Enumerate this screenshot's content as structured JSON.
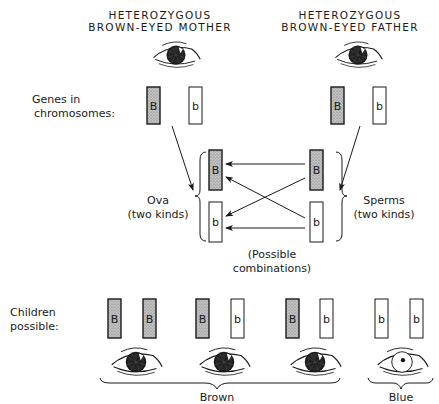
{
  "mother": {
    "title_line1": "HETEROZYGOUS",
    "title_line2": "BROWN-EYED MOTHER",
    "eye_color": "brown",
    "genes": [
      "B",
      "b"
    ]
  },
  "father": {
    "title_line1": "HETEROZYGOUS",
    "title_line2": "BROWN-EYED FATHER",
    "eye_color": "brown",
    "genes": [
      "B",
      "b"
    ]
  },
  "labels": {
    "genes_line1": "Genes in",
    "genes_line2": "chromosomes:",
    "ova_line1": "Ova",
    "ova_line2": "(two kinds)",
    "sperms_line1": "Sperms",
    "sperms_line2": "(two kinds)",
    "combinations_line1": "(Possible",
    "combinations_line2": "combinations)",
    "children_line1": "Children",
    "children_line2": "possible:"
  },
  "ova": [
    "B",
    "b"
  ],
  "sperms": [
    "B",
    "b"
  ],
  "children": [
    {
      "genes": [
        "B",
        "B"
      ],
      "eye_color": "brown"
    },
    {
      "genes": [
        "B",
        "b"
      ],
      "eye_color": "brown"
    },
    {
      "genes": [
        "B",
        "b"
      ],
      "eye_color": "brown"
    },
    {
      "genes": [
        "b",
        "b"
      ],
      "eye_color": "blue"
    }
  ],
  "groups": {
    "brown_label": "Brown",
    "blue_label": "Blue"
  },
  "colors": {
    "dominant_fill": "#b8b8b8",
    "recessive_fill": "#ffffff",
    "ink": "#1a1a1a"
  }
}
